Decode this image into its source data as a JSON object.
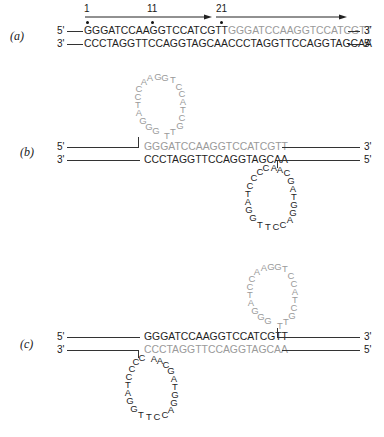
{
  "panels": {
    "a": {
      "label": "(a)",
      "ticks": [
        "1",
        "11",
        "21"
      ],
      "top_left_end": "5'",
      "top_right_end": "3'",
      "bottom_left_end": "3'",
      "bottom_right_end": "5'",
      "top_seq_dark": "GGGATCCAAGGTCCATCGTT",
      "top_seq_gray": "GGGATCCAAGGTCCATCGTT",
      "bottom_seq_dark": "CCCTAGGTTCCAGGTAGCAA",
      "bottom_seq_gray": "CCCTAGGTTCCAGGTAGCAA"
    },
    "b": {
      "label": "(b)",
      "top_left_end": "5'",
      "top_right_end": "3'",
      "bottom_left_end": "3'",
      "bottom_right_end": "5'",
      "top_seq_gray": "GGGATCCAAGGTCCATCGTT",
      "bottom_seq_dark": "CCCTAGGTTCCAGGTAGCAA",
      "upper_loop": "GGGATCCAAGGTCCATCGTT",
      "lower_loop": "CCCTAGGTTCCAGGTAGCAA"
    },
    "c": {
      "label": "(c)",
      "top_left_end": "5'",
      "top_right_end": "3'",
      "bottom_left_end": "3'",
      "bottom_right_end": "5'",
      "top_seq_dark": "GGGATCCAAGGTCCATCGTT",
      "bottom_seq_gray": "CCCTAGGTTCCAGGTAGCAA",
      "upper_loop": "GGGATCCAAGGTCCATCGTT",
      "lower_loop": "CCCTAGGTTCCAGGTAGCAA"
    }
  },
  "colors": {
    "dark": "#1e1e1e",
    "gray": "#9a9a9a",
    "line": "#333333"
  }
}
